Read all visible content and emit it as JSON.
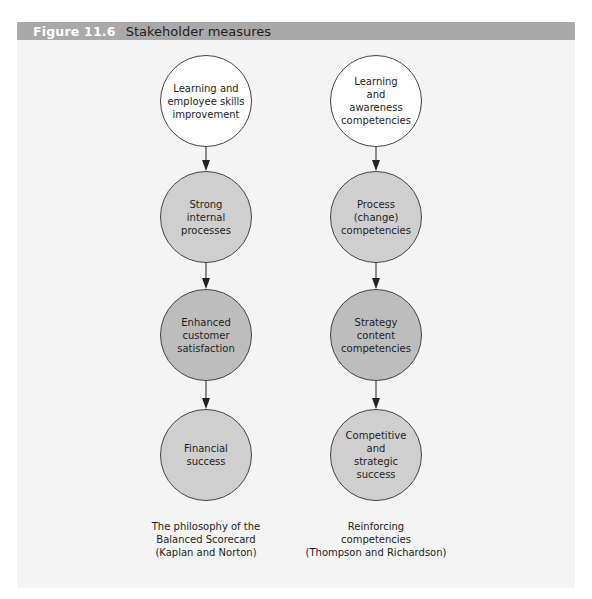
{
  "header": {
    "figure_number": "Figure 11.6",
    "title": "Stakeholder measures"
  },
  "colors": {
    "header_bar": "#a9a9a9",
    "panel_bg": "#f4f4f4",
    "node_first": "#ffffff",
    "node_process": "#cfcfcf",
    "node_outcome": "#bdbdbd",
    "outline": "#444444"
  },
  "columns": [
    {
      "nodes": [
        {
          "label": "Learning and\nemployee skills\nimprovement"
        },
        {
          "label": "Strong\ninternal\nprocesses"
        },
        {
          "label": "Enhanced\ncustomer\nsatisfaction"
        },
        {
          "label": "Financial\nsuccess"
        }
      ],
      "caption": "The philosophy of the\nBalanced Scorecard\n(Kaplan and Norton)"
    },
    {
      "nodes": [
        {
          "label": "Learning\nand\nawareness\ncompetencies"
        },
        {
          "label": "Process\n(change)\ncompetencies"
        },
        {
          "label": "Strategy\ncontent\ncompetencies"
        },
        {
          "label": "Competitive\nand\nstrategic\nsuccess"
        }
      ],
      "caption": "Reinforcing\ncompetencies\n(Thompson and Richardson)"
    }
  ]
}
